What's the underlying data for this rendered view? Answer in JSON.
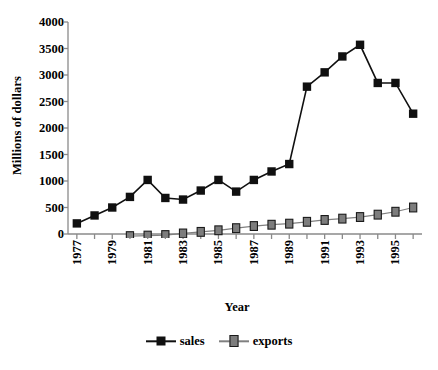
{
  "chart_data": {
    "type": "line",
    "title": "",
    "xlabel": "Year",
    "ylabel": "Millions of dollars",
    "x": [
      1977,
      1978,
      1979,
      1980,
      1981,
      1982,
      1983,
      1984,
      1985,
      1986,
      1987,
      1988,
      1989,
      1990,
      1991,
      1992,
      1993,
      1994,
      1995,
      1996
    ],
    "xlim": [
      1976.5,
      1996.5
    ],
    "ylim": [
      0,
      4000
    ],
    "yticks": [
      0,
      500,
      1000,
      1500,
      2000,
      2500,
      3000,
      3500,
      4000
    ],
    "ytick_labels": [
      "0",
      "500",
      "1000",
      "1500",
      "2000",
      "2500",
      "3000",
      "3500",
      "4000"
    ],
    "xtick_labels": [
      "1977",
      "",
      "1979",
      "",
      "1981",
      "",
      "1983",
      "",
      "1985",
      "",
      "1987",
      "",
      "1989",
      "",
      "1991",
      "",
      "1993",
      "",
      "1995",
      ""
    ],
    "grid": false,
    "legend_position": "bottom",
    "series": [
      {
        "name": "sales",
        "color": "#101010",
        "marker": "filled-square",
        "values": [
          200,
          350,
          500,
          700,
          1020,
          680,
          650,
          820,
          1020,
          800,
          1020,
          1180,
          1320,
          2780,
          3050,
          3350,
          3570,
          2850,
          2850,
          2270
        ]
      },
      {
        "name": "exports",
        "color": "#808080",
        "marker": "gray-square",
        "values": [
          null,
          null,
          null,
          -40,
          -30,
          -20,
          10,
          40,
          70,
          110,
          150,
          175,
          195,
          230,
          265,
          290,
          320,
          365,
          420,
          500
        ]
      }
    ]
  },
  "legend": {
    "entries": [
      {
        "label": "sales"
      },
      {
        "label": "exports"
      }
    ]
  },
  "axes": {
    "ylabel": "Millions of dollars",
    "xlabel": "Year"
  },
  "colors": {
    "sales": "#101010",
    "exports": "#808080",
    "axis": "#8a8a8a",
    "background": "#ffffff",
    "text": "#000000"
  }
}
